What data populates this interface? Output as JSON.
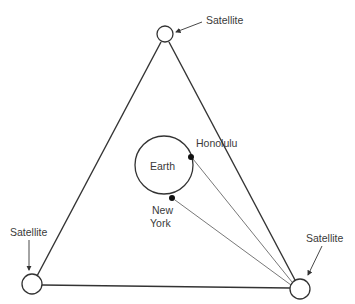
{
  "diagram": {
    "type": "satellite-network",
    "satellites": [
      {
        "id": "top",
        "label": "Satellite"
      },
      {
        "id": "bottom-left",
        "label": "Satellite"
      },
      {
        "id": "bottom-right",
        "label": "Satellite"
      }
    ],
    "earth": {
      "label": "Earth"
    },
    "cities": [
      {
        "name": "Honolulu",
        "label": "Honolulu"
      },
      {
        "name": "New York",
        "label_line1": "New",
        "label_line2": "York"
      }
    ],
    "links": [
      {
        "from": "bottom-right",
        "to": "Honolulu"
      },
      {
        "from": "bottom-right",
        "to": "New York"
      }
    ],
    "colors": {
      "stroke": "#333333",
      "text": "#3a3a3a",
      "background": "#ffffff"
    }
  }
}
